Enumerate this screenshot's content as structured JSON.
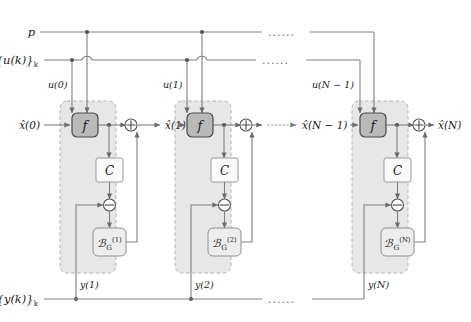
{
  "figure": {
    "type": "block-diagram",
    "background": "#ffffff",
    "colors": {
      "wire": "#808080",
      "group_fill": "#e2e2e2",
      "f_block_fill": "#b9b9b9",
      "c_block_fill": "#fafafa",
      "k_block_fill": "#ededed",
      "text": "#1a1a1a"
    }
  },
  "rails": {
    "parameter": {
      "label": "p",
      "y": 32
    },
    "input": {
      "label_main": "{u(k)}",
      "label_sub": "k",
      "y": 60
    },
    "output": {
      "label_main": "{y(k)}",
      "label_sub": "k",
      "y": 299
    }
  },
  "ellipses": {
    "glyph": "......",
    "p_rail": "......",
    "u_rail": "......",
    "state_chain": "......",
    "y_rail": "......"
  },
  "states": {
    "initial": "x̂(0)",
    "after_stage_1": "x̂(1)",
    "before_last": "x̂(N − 1)",
    "final": "x̂(N)"
  },
  "stages": [
    {
      "index": 1,
      "input_label": "u(0)",
      "f_label": "f",
      "c_label": "C",
      "gain_main": "ℬ",
      "gain_sub": "G",
      "gain_sup": "(1)",
      "measurement_label": "y(1)",
      "sum_symbol": "⊕",
      "diff_symbol": "⊖"
    },
    {
      "index": 2,
      "input_label": "u(1)",
      "f_label": "f",
      "c_label": "C",
      "gain_main": "ℬ",
      "gain_sub": "G",
      "gain_sup": "(2)",
      "measurement_label": "y(2)",
      "sum_symbol": "⊕",
      "diff_symbol": "⊖"
    },
    {
      "index": 3,
      "input_label": "u(N − 1)",
      "f_label": "f",
      "c_label": "C",
      "gain_main": "ℬ",
      "gain_sub": "G",
      "gain_sup": "(N)",
      "measurement_label": "y(N)",
      "sum_symbol": "⊕",
      "diff_symbol": "⊖"
    }
  ]
}
